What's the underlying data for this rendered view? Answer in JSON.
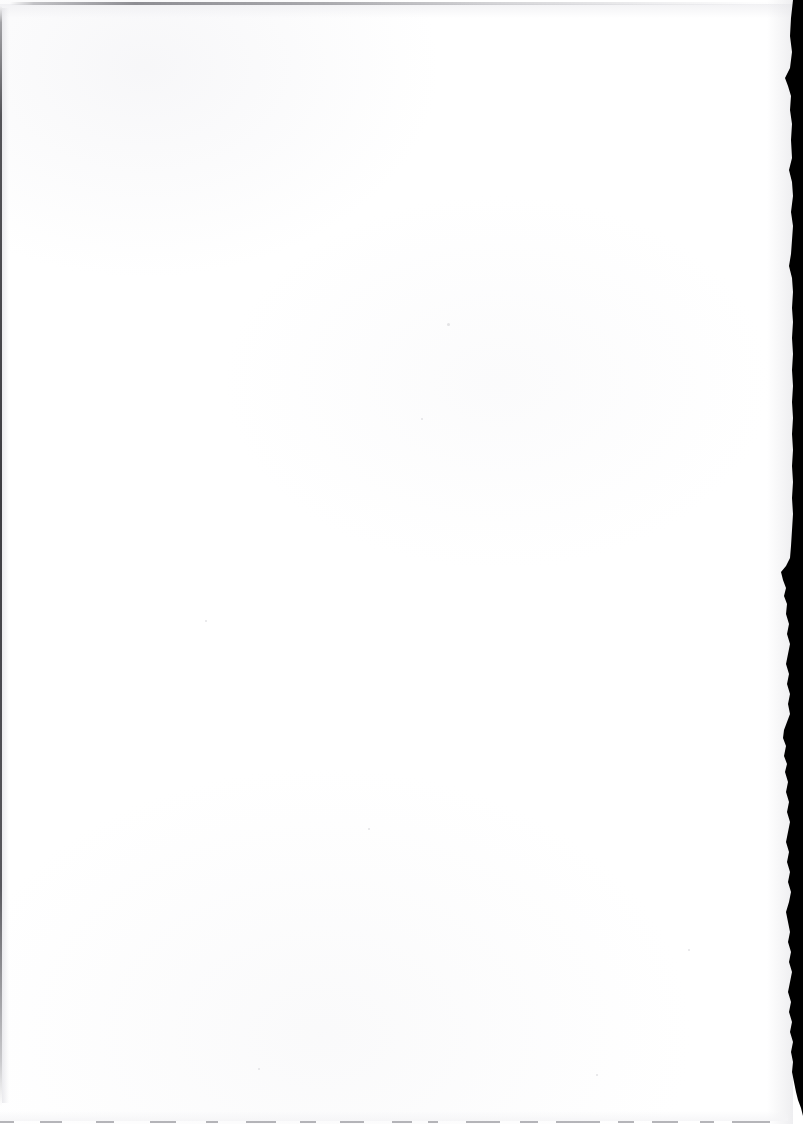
{
  "document": {
    "kind": "scanned-page",
    "page_content_text": "",
    "page_state_label": "blank",
    "width_px": 803,
    "height_px": 1124,
    "background_color": "#ffffff",
    "paper_tone_color": "#fafafb"
  },
  "edges": {
    "top": {
      "name": "top-edge-line",
      "color": "#6e6e72",
      "y_px": 2,
      "thickness_px": 3,
      "description_label": "faint gray rule at top of scan"
    },
    "left": {
      "name": "left-edge-line",
      "color": "#2e2e33",
      "x_px": 0,
      "thickness_px": 2,
      "description_label": "thin dark line down left page edge"
    },
    "right": {
      "name": "right-edge-black-border",
      "color": "#000000",
      "min_x_px": 783,
      "max_x_px": 803,
      "description_label": "ragged black scanner bed border"
    },
    "bottom": {
      "name": "bottom-edge-line",
      "color": "#787880",
      "y_px": 1121,
      "thickness_px": 2,
      "description_label": "faint broken dark line at bottom page edge"
    }
  },
  "right_border_profile": [
    [
      0,
      793
    ],
    [
      18,
      791
    ],
    [
      36,
      790
    ],
    [
      52,
      792
    ],
    [
      68,
      790
    ],
    [
      78,
      785
    ],
    [
      86,
      788
    ],
    [
      96,
      791
    ],
    [
      110,
      790
    ],
    [
      124,
      792
    ],
    [
      140,
      791
    ],
    [
      158,
      792
    ],
    [
      170,
      789
    ],
    [
      182,
      792
    ],
    [
      196,
      793
    ],
    [
      212,
      791
    ],
    [
      226,
      793
    ],
    [
      240,
      792
    ],
    [
      254,
      791
    ],
    [
      266,
      789
    ],
    [
      278,
      792
    ],
    [
      292,
      793
    ],
    [
      308,
      792
    ],
    [
      322,
      793
    ],
    [
      338,
      792
    ],
    [
      354,
      793
    ],
    [
      370,
      792
    ],
    [
      386,
      793
    ],
    [
      402,
      792
    ],
    [
      418,
      793
    ],
    [
      434,
      792
    ],
    [
      450,
      793
    ],
    [
      466,
      792
    ],
    [
      482,
      793
    ],
    [
      498,
      792
    ],
    [
      514,
      793
    ],
    [
      530,
      792
    ],
    [
      546,
      791
    ],
    [
      558,
      790
    ],
    [
      566,
      786
    ],
    [
      572,
      781
    ],
    [
      580,
      783
    ],
    [
      588,
      786
    ],
    [
      596,
      784
    ],
    [
      604,
      787
    ],
    [
      614,
      786
    ],
    [
      624,
      789
    ],
    [
      634,
      787
    ],
    [
      644,
      790
    ],
    [
      654,
      788
    ],
    [
      664,
      786
    ],
    [
      674,
      789
    ],
    [
      684,
      787
    ],
    [
      694,
      790
    ],
    [
      704,
      788
    ],
    [
      714,
      790
    ],
    [
      722,
      787
    ],
    [
      730,
      784
    ],
    [
      738,
      783
    ],
    [
      746,
      786
    ],
    [
      756,
      784
    ],
    [
      764,
      787
    ],
    [
      772,
      785
    ],
    [
      782,
      788
    ],
    [
      792,
      786
    ],
    [
      802,
      789
    ],
    [
      812,
      787
    ],
    [
      822,
      790
    ],
    [
      832,
      788
    ],
    [
      842,
      786
    ],
    [
      852,
      789
    ],
    [
      862,
      787
    ],
    [
      872,
      790
    ],
    [
      882,
      788
    ],
    [
      892,
      791
    ],
    [
      902,
      789
    ],
    [
      912,
      786
    ],
    [
      922,
      788
    ],
    [
      932,
      790
    ],
    [
      942,
      788
    ],
    [
      952,
      791
    ],
    [
      962,
      789
    ],
    [
      972,
      792
    ],
    [
      982,
      790
    ],
    [
      992,
      788
    ],
    [
      1002,
      791
    ],
    [
      1012,
      789
    ],
    [
      1022,
      792
    ],
    [
      1032,
      790
    ],
    [
      1042,
      793
    ],
    [
      1052,
      791
    ],
    [
      1062,
      793
    ],
    [
      1072,
      792
    ],
    [
      1082,
      794
    ],
    [
      1092,
      796
    ],
    [
      1100,
      798
    ],
    [
      1108,
      801
    ],
    [
      1116,
      803
    ],
    [
      1124,
      803
    ]
  ],
  "bottom_dashes": [
    {
      "left_px": 0,
      "width_px": 14
    },
    {
      "left_px": 40,
      "width_px": 22
    },
    {
      "left_px": 96,
      "width_px": 18
    },
    {
      "left_px": 150,
      "width_px": 26
    },
    {
      "left_px": 206,
      "width_px": 12
    },
    {
      "left_px": 246,
      "width_px": 30
    },
    {
      "left_px": 300,
      "width_px": 16
    },
    {
      "left_px": 340,
      "width_px": 24
    },
    {
      "left_px": 392,
      "width_px": 20
    },
    {
      "left_px": 428,
      "width_px": 10
    },
    {
      "left_px": 466,
      "width_px": 34
    },
    {
      "left_px": 520,
      "width_px": 18
    },
    {
      "left_px": 556,
      "width_px": 44
    },
    {
      "left_px": 618,
      "width_px": 16
    },
    {
      "left_px": 652,
      "width_px": 26
    },
    {
      "left_px": 700,
      "width_px": 14
    },
    {
      "left_px": 732,
      "width_px": 38
    }
  ],
  "specks": [
    {
      "x_px": 447,
      "y_px": 323,
      "size_px": 3
    },
    {
      "x_px": 421,
      "y_px": 418,
      "size_px": 2
    },
    {
      "x_px": 205,
      "y_px": 620,
      "size_px": 2
    },
    {
      "x_px": 368,
      "y_px": 828,
      "size_px": 2
    },
    {
      "x_px": 688,
      "y_px": 949,
      "size_px": 2
    },
    {
      "x_px": 258,
      "y_px": 1068,
      "size_px": 2
    },
    {
      "x_px": 596,
      "y_px": 1074,
      "size_px": 2
    }
  ]
}
